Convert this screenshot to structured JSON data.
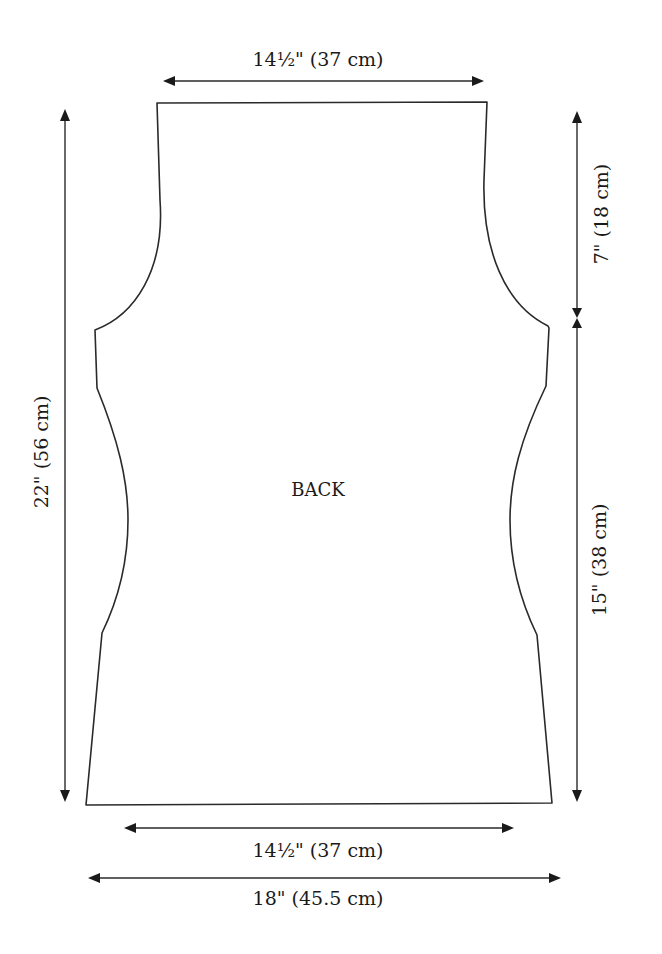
{
  "piece": {
    "label": "BACK"
  },
  "dimensions": {
    "top_width": "14½\" (37 cm)",
    "armhole_depth": "7\" (18 cm)",
    "side_length": "15\" (38 cm)",
    "total_length": "22\" (56 cm)",
    "waist_width": "14½\" (37 cm)",
    "hip_width": "18\" (45.5 cm)"
  }
}
